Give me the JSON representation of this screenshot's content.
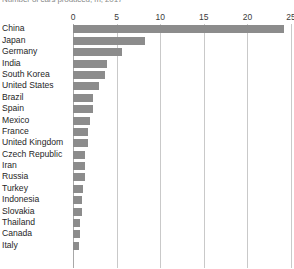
{
  "chart_data": {
    "type": "bar",
    "orientation": "horizontal",
    "title": "Number of cars produced, m, 2017",
    "xlabel": "",
    "ylabel": "",
    "xlim": [
      0,
      25
    ],
    "xticks": [
      0,
      5,
      10,
      15,
      20,
      25
    ],
    "grid": true,
    "legend": false,
    "bar_color": "#8c8c8c",
    "gridline_color": "#c9c9c9",
    "categories": [
      "China",
      "Japan",
      "Germany",
      "India",
      "South Korea",
      "United States",
      "Brazil",
      "Spain",
      "Mexico",
      "France",
      "United Kingdom",
      "Czech Republic",
      "Iran",
      "Russia",
      "Turkey",
      "Indonesia",
      "Slovakia",
      "Thailand",
      "Canada",
      "Italy"
    ],
    "values": [
      24.2,
      8.3,
      5.6,
      3.9,
      3.7,
      3.0,
      2.3,
      2.3,
      1.9,
      1.7,
      1.7,
      1.4,
      1.4,
      1.4,
      1.1,
      1.0,
      1.0,
      0.8,
      0.8,
      0.7
    ]
  }
}
